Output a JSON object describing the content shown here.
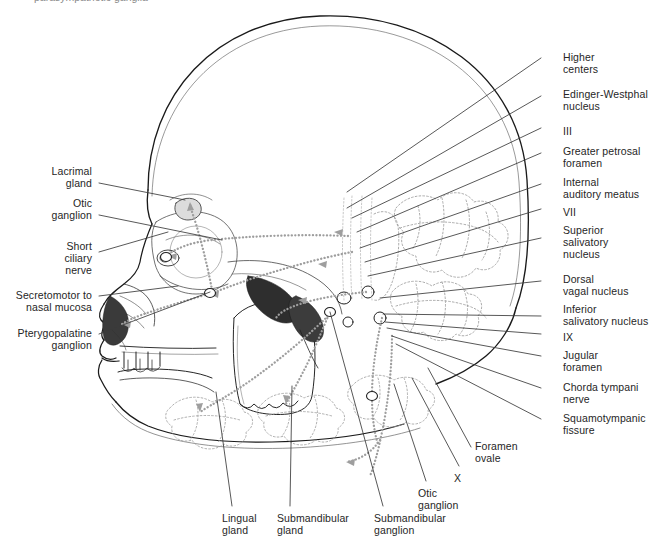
{
  "figure": {
    "type": "anatomical-diagram",
    "background_color": "#ffffff",
    "line_color": "#1a1a1a",
    "dotted_nerve_color": "#9a9a9a",
    "leader_color": "#3a3a3a",
    "top_cut_text": "parasympathetic ganglia"
  },
  "labels_right": [
    {
      "id": "higher-centers",
      "text": "Higher\ncenters",
      "x": 563,
      "y": 51,
      "lx1": 541,
      "ly1": 58,
      "lx2": 347,
      "ly2": 192
    },
    {
      "id": "edinger-westphal-nucleus",
      "text": "Edinger-Westphal\nnucleus",
      "x": 563,
      "y": 88,
      "lx1": 541,
      "ly1": 96,
      "lx2": 347,
      "ly2": 208
    },
    {
      "id": "iii",
      "text": "III",
      "x": 563,
      "y": 125,
      "lx1": 541,
      "ly1": 128,
      "lx2": 352,
      "ly2": 218
    },
    {
      "id": "greater-petrosal-foramen",
      "text": "Greater petrosal\nforamen",
      "x": 563,
      "y": 145,
      "lx1": 541,
      "ly1": 153,
      "lx2": 357,
      "ly2": 232
    },
    {
      "id": "internal-auditory-meatus",
      "text": "Internal\nauditory meatus",
      "x": 563,
      "y": 176,
      "lx1": 541,
      "ly1": 184,
      "lx2": 360,
      "ly2": 248
    },
    {
      "id": "vii",
      "text": "VII",
      "x": 563,
      "y": 206,
      "lx1": 541,
      "ly1": 209,
      "lx2": 365,
      "ly2": 262
    },
    {
      "id": "superior-salivatory-nucleus",
      "text": "Superior\nsalivatory\nnucleus",
      "x": 563,
      "y": 224,
      "lx1": 541,
      "ly1": 238,
      "lx2": 368,
      "ly2": 276
    },
    {
      "id": "dorsal-vagal-nucleus",
      "text": "Dorsal\nvagal nucleus",
      "x": 563,
      "y": 273,
      "lx1": 541,
      "ly1": 281,
      "lx2": 380,
      "ly2": 298
    },
    {
      "id": "inferior-salivatory-nucleus",
      "text": "Inferior\nsalivatory nucleus",
      "x": 563,
      "y": 303,
      "lx1": 541,
      "ly1": 316,
      "lx2": 383,
      "ly2": 314
    },
    {
      "id": "ix",
      "text": "IX",
      "x": 563,
      "y": 331,
      "lx1": 541,
      "ly1": 334,
      "lx2": 385,
      "ly2": 322
    },
    {
      "id": "jugular-foramen",
      "text": "Jugular\nforamen",
      "x": 563,
      "y": 349,
      "lx1": 541,
      "ly1": 356,
      "lx2": 387,
      "ly2": 328
    },
    {
      "id": "chorda-tympani-nerve",
      "text": "Chorda tympani\nnerve",
      "x": 563,
      "y": 381,
      "lx1": 541,
      "ly1": 388,
      "lx2": 392,
      "ly2": 336
    },
    {
      "id": "squamotympanic-fissure",
      "text": "Squamotympanic\nfissure",
      "x": 563,
      "y": 412,
      "lx1": 541,
      "ly1": 419,
      "lx2": 396,
      "ly2": 344
    }
  ],
  "labels_left": [
    {
      "id": "lacrimal-gland",
      "text": "Lacrimal\ngland",
      "rx": 92,
      "y": 165,
      "lx1": 99,
      "ly1": 183,
      "lx2": 185,
      "ly2": 200
    },
    {
      "id": "otic-ganglion-left",
      "text": "Otic\nganglion",
      "rx": 92,
      "y": 197,
      "lx1": 99,
      "ly1": 215,
      "lx2": 222,
      "ly2": 240
    },
    {
      "id": "short-ciliary-nerve",
      "text": "Short\nciliary\nnerve",
      "rx": 92,
      "y": 240,
      "lx1": 99,
      "ly1": 252,
      "lx2": 168,
      "ly2": 232
    },
    {
      "id": "secretomotor-nasal-mucosa",
      "text": "Secretomotor to\nnasal mucosa",
      "rx": 92,
      "y": 289,
      "lx1": 99,
      "ly1": 296,
      "lx2": 178,
      "ly2": 286
    },
    {
      "id": "pterygopalatine-ganglion",
      "text": "Pterygopalatine\nganglion",
      "rx": 92,
      "y": 327,
      "lx1": 99,
      "ly1": 334,
      "lx2": 210,
      "ly2": 292
    }
  ],
  "labels_bottom": [
    {
      "id": "lingual-gland",
      "text": "Lingual\ngland",
      "x": 222,
      "y": 512,
      "lx1": 232,
      "ly1": 506,
      "lx2": 216,
      "ly2": 392
    },
    {
      "id": "submandibular-gland",
      "text": "Submandibular\ngland",
      "x": 277,
      "y": 512,
      "lx1": 290,
      "ly1": 506,
      "lx2": 292,
      "ly2": 386
    },
    {
      "id": "submandibular-ganglion",
      "text": "Submandibular\nganglion",
      "x": 374,
      "y": 512,
      "lx1": 383,
      "ly1": 506,
      "lx2": 330,
      "ly2": 312
    },
    {
      "id": "otic-ganglion-bottom",
      "text": "Otic\nganglion",
      "x": 418,
      "y": 487,
      "lx1": 426,
      "ly1": 481,
      "lx2": 394,
      "ly2": 384
    },
    {
      "id": "x",
      "text": "X",
      "x": 454,
      "y": 472,
      "lx1": 459,
      "ly1": 466,
      "lx2": 412,
      "ly2": 378
    },
    {
      "id": "foramen-ovale",
      "text": "Foramen\novale",
      "x": 475,
      "y": 440,
      "lx1": 471,
      "ly1": 447,
      "lx2": 428,
      "ly2": 368
    }
  ]
}
